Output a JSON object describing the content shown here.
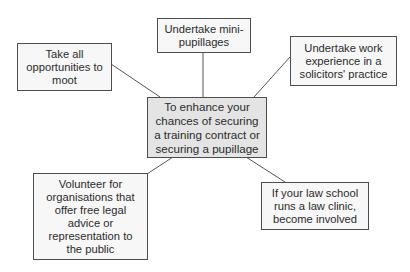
{
  "diagram": {
    "type": "spider-diagram",
    "colors": {
      "border": "#4d4d4d",
      "center_fill": "#e4e4e4",
      "node_fill": "#f7f7f7",
      "connector": "#555555",
      "text": "#2b2b2b"
    },
    "center": {
      "text": "To enhance your\nchances of securing\na training contract or\nsecuring a pupillage"
    },
    "nodes": [
      {
        "id": "moot",
        "text": "Take all\nopportunities to\nmoot"
      },
      {
        "id": "mini-pupillages",
        "text": "Undertake mini-\npupillages"
      },
      {
        "id": "work-experience",
        "text": "Undertake work\nexperience in a\nsolicitors' practice"
      },
      {
        "id": "volunteer",
        "text": "Volunteer for\norganisations that\noffer free legal\nadvice or\nrepresentation to\nthe public"
      },
      {
        "id": "law-clinic",
        "text": "If your law school\nruns a law clinic,\nbecome involved"
      }
    ],
    "edges": [
      {
        "from": "center",
        "to": "moot"
      },
      {
        "from": "center",
        "to": "mini-pupillages"
      },
      {
        "from": "center",
        "to": "work-experience"
      },
      {
        "from": "center",
        "to": "volunteer"
      },
      {
        "from": "center",
        "to": "law-clinic"
      }
    ]
  }
}
